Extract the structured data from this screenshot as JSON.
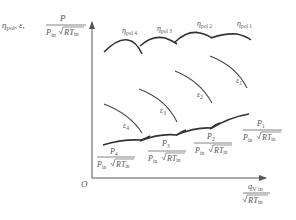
{
  "axes": {
    "origin_label": "O",
    "y_label": {
      "eta": "η",
      "eta_sub": "pol",
      "sep1": ",",
      "eps": "ε",
      "sep2": ",",
      "num": "P",
      "den_p": "P",
      "den_p_sub": "in",
      "den_rt": "RT",
      "den_rt_sub": "in"
    },
    "x_label": {
      "num_q": "q",
      "num_q_sub": "V in",
      "den_rt": "RT",
      "den_rt_sub": "in"
    }
  },
  "curves": {
    "efficiency": [
      {
        "label": "η",
        "sub": "pol 4"
      },
      {
        "label": "η",
        "sub": "pol 3"
      },
      {
        "label": "η",
        "sub": "pol 2"
      },
      {
        "label": "η",
        "sub": "pol 1"
      }
    ],
    "pressure_ratio": [
      {
        "label": "ε",
        "sub": "1"
      },
      {
        "label": "ε",
        "sub": "2"
      },
      {
        "label": "ε",
        "sub": "3"
      },
      {
        "label": "ε",
        "sub": "4"
      }
    ],
    "power": [
      {
        "num": "P",
        "num_sub": "4",
        "den_p": "P",
        "den_p_sub": "in",
        "den_rt": "RT",
        "den_rt_sub": "in"
      },
      {
        "num": "P",
        "num_sub": "3",
        "den_p": "P",
        "den_p_sub": "in",
        "den_rt": "RT",
        "den_rt_sub": "in"
      },
      {
        "num": "P",
        "num_sub": "2",
        "den_p": "P",
        "den_p_sub": "in",
        "den_rt": "RT",
        "den_rt_sub": "in"
      },
      {
        "num": "P",
        "num_sub": "1",
        "den_p": "P",
        "den_p_sub": "in",
        "den_rt": "RT",
        "den_rt_sub": "in"
      }
    ]
  }
}
